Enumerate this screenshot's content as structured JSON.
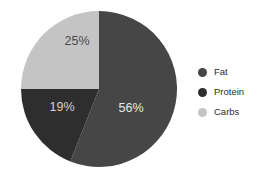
{
  "chart_data": {
    "type": "pie",
    "title": "",
    "subtitle": "",
    "xlabel": "",
    "ylabel": "",
    "grid": false,
    "legend_position": "right",
    "categories": [
      "Fat",
      "Protein",
      "Carbs"
    ],
    "values": [
      56,
      19,
      25
    ],
    "unit": "%",
    "start_angle_deg": 0,
    "direction": "clockwise",
    "slices": [
      {
        "name": "Fat",
        "value": 56,
        "data_label": "56%",
        "color": "#464646",
        "label_color": "#e8e8e8",
        "start_deg": 0,
        "end_deg": 201.6
      },
      {
        "name": "Protein",
        "value": 19,
        "data_label": "19%",
        "color": "#2e2e2e",
        "label_color": "#d2d2d2",
        "start_deg": 201.6,
        "end_deg": 270.0
      },
      {
        "name": "Carbs",
        "value": 25,
        "data_label": "25%",
        "color": "#c4c4c4",
        "label_color": "#4a4a4a",
        "start_deg": 270.0,
        "end_deg": 360.0
      }
    ],
    "geometry": {
      "center_x": 99,
      "center_y": 89,
      "radius": 78,
      "label_radius": 46
    },
    "label_positions": [
      {
        "text": "56%",
        "x": 131,
        "y": 112
      },
      {
        "text": "19%",
        "x": 62,
        "y": 111
      },
      {
        "text": "25%",
        "x": 77,
        "y": 45
      }
    ],
    "background": "#ffffff"
  },
  "legend": {
    "items": [
      {
        "label": "Fat",
        "color": "#464646"
      },
      {
        "label": "Protein",
        "color": "#2e2e2e"
      },
      {
        "label": "Carbs",
        "color": "#c4c4c4"
      }
    ]
  }
}
